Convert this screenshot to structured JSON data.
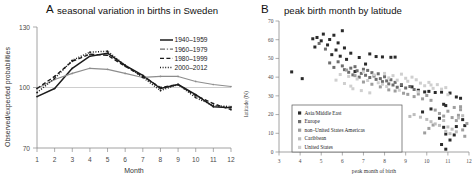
{
  "figure": {
    "panel_a": {
      "letter": "A",
      "title": "seasonal variation in births in Sweden",
      "xlabel": "Month",
      "ylabel": "Observed/expected probabilities"
    },
    "panel_b": {
      "letter": "B",
      "title": "peak birth month by latitude",
      "xlabel": "peak month of birth",
      "ylabel": "latitude (N)"
    }
  },
  "chart_data": [
    {
      "type": "line",
      "panel": "A",
      "title": "seasonal variation in births in Sweden",
      "xlabel": "Month",
      "ylabel": "Observed/expected probabilities",
      "xlim": [
        1,
        12
      ],
      "ylim": [
        70,
        130
      ],
      "yticks": [
        70,
        100,
        130
      ],
      "xticks": [
        1,
        2,
        3,
        4,
        5,
        6,
        7,
        8,
        9,
        10,
        11,
        12
      ],
      "grid": true,
      "legend_position": "top-right",
      "categories": [
        1,
        2,
        3,
        4,
        5,
        6,
        7,
        8,
        9,
        10,
        11,
        12
      ],
      "series": [
        {
          "name": "1940–1959",
          "style": "solid",
          "values": [
            95.5,
            99.5,
            109.5,
            115.5,
            117.0,
            111.0,
            106.0,
            99.5,
            101.5,
            96.5,
            90.5,
            90.0
          ]
        },
        {
          "name": "1960–1979",
          "style": "dash-dot",
          "values": [
            99.5,
            104.0,
            107.0,
            109.5,
            109.0,
            107.0,
            105.0,
            105.5,
            105.5,
            103.0,
            101.5,
            100.5
          ]
        },
        {
          "name": "1980–1999",
          "style": "dashed",
          "values": [
            99.5,
            105.5,
            113.0,
            116.5,
            116.0,
            110.5,
            105.5,
            100.0,
            101.5,
            96.0,
            92.0,
            89.0
          ]
        },
        {
          "name": "2000–2012",
          "style": "dotted",
          "values": [
            97.5,
            104.5,
            113.5,
            117.5,
            118.0,
            111.0,
            105.0,
            98.5,
            101.5,
            95.0,
            91.0,
            90.5
          ]
        }
      ]
    },
    {
      "type": "scatter",
      "panel": "B",
      "title": "peak birth month by latitude",
      "xlabel": "peak month of birth",
      "ylabel": "latitude (N)",
      "xlim": [
        3,
        12
      ],
      "ylim": [
        0,
        70
      ],
      "xticks": [
        3,
        4,
        5,
        6,
        7,
        8,
        9,
        10,
        11,
        12
      ],
      "yticks": [
        0,
        10,
        20,
        30,
        40,
        50,
        60,
        70
      ],
      "grid": false,
      "legend_position": "bottom-left",
      "series": [
        {
          "name": "Asia/Middle East",
          "color": "#2a2a2a",
          "points": [
            [
              3.6,
              42.8
            ],
            [
              4.1,
              39.2
            ],
            [
              4.6,
              60.5
            ],
            [
              4.7,
              56.1
            ],
            [
              4.8,
              61.2
            ],
            [
              5.0,
              59.4
            ],
            [
              5.1,
              63.0
            ],
            [
              5.3,
              57.2
            ],
            [
              5.4,
              60.1
            ],
            [
              5.5,
              52.0
            ],
            [
              5.6,
              62.4
            ],
            [
              5.7,
              54.5
            ],
            [
              5.8,
              58.3
            ],
            [
              5.9,
              51.2
            ],
            [
              6.0,
              64.8
            ],
            [
              6.1,
              55.6
            ],
            [
              6.2,
              49.5
            ],
            [
              6.4,
              52.8
            ],
            [
              6.6,
              43.0
            ],
            [
              6.8,
              50.5
            ],
            [
              7.1,
              47.0
            ],
            [
              7.3,
              52.4
            ],
            [
              7.6,
              51.0
            ],
            [
              7.9,
              50.8
            ],
            [
              8.3,
              50.6
            ],
            [
              8.5,
              50.7
            ],
            [
              8.8,
              35.6
            ],
            [
              9.3,
              34.8
            ],
            [
              9.6,
              33.0
            ],
            [
              9.9,
              32.1
            ],
            [
              10.1,
              32.4
            ],
            [
              10.4,
              31.8
            ],
            [
              10.7,
              32.0
            ],
            [
              11.1,
              31.5
            ],
            [
              11.4,
              29.4
            ],
            [
              11.6,
              28.7
            ],
            [
              10.8,
              25.5
            ],
            [
              10.9,
              24.8
            ],
            [
              10.6,
              18.0
            ],
            [
              10.8,
              13.2
            ],
            [
              10.9,
              9.6
            ],
            [
              11.3,
              9.1
            ],
            [
              11.4,
              13.6
            ],
            [
              11.1,
              6.4
            ],
            [
              10.7,
              4.0
            ],
            [
              10.9,
              1.5
            ],
            [
              11.7,
              17.3
            ],
            [
              11.8,
              14.1
            ],
            [
              9.8,
              21.4
            ],
            [
              10.2,
              23.0
            ]
          ]
        },
        {
          "name": "Europe",
          "color": "#6e6e6e",
          "points": [
            [
              4.9,
              58.0
            ],
            [
              5.2,
              55.0
            ],
            [
              5.4,
              47.6
            ],
            [
              5.6,
              45.2
            ],
            [
              5.8,
              48.2
            ],
            [
              6.0,
              46.0
            ],
            [
              6.1,
              44.0
            ],
            [
              6.3,
              42.6
            ],
            [
              6.4,
              44.8
            ],
            [
              6.5,
              41.2
            ],
            [
              6.6,
              45.6
            ],
            [
              6.7,
              43.4
            ],
            [
              6.8,
              40.0
            ],
            [
              6.9,
              42.0
            ],
            [
              7.0,
              44.2
            ],
            [
              7.1,
              41.0
            ],
            [
              7.2,
              43.6
            ],
            [
              7.3,
              39.8
            ],
            [
              7.4,
              42.4
            ],
            [
              7.5,
              40.6
            ],
            [
              7.6,
              38.8
            ],
            [
              7.7,
              41.8
            ],
            [
              7.8,
              39.2
            ],
            [
              7.9,
              37.6
            ],
            [
              8.0,
              40.2
            ],
            [
              8.1,
              38.0
            ],
            [
              8.2,
              36.4
            ],
            [
              8.3,
              38.6
            ],
            [
              8.4,
              35.8
            ],
            [
              8.5,
              37.2
            ],
            [
              8.6,
              34.6
            ],
            [
              8.8,
              36.0
            ],
            [
              9.0,
              34.2
            ],
            [
              9.2,
              35.0
            ],
            [
              9.4,
              33.4
            ]
          ]
        },
        {
          "name": "non–United States Americas",
          "color": "#9e9e9e",
          "points": [
            [
              6.2,
              43.8
            ],
            [
              6.6,
              40.8
            ],
            [
              7.0,
              37.4
            ],
            [
              7.4,
              36.2
            ],
            [
              7.8,
              34.8
            ],
            [
              8.2,
              33.2
            ],
            [
              8.5,
              32.6
            ],
            [
              8.9,
              31.4
            ],
            [
              9.1,
              30.8
            ],
            [
              9.4,
              29.6
            ],
            [
              9.6,
              31.0
            ],
            [
              9.8,
              28.4
            ],
            [
              10.0,
              30.2
            ],
            [
              10.2,
              27.6
            ],
            [
              10.4,
              22.4
            ],
            [
              10.6,
              20.6
            ],
            [
              10.8,
              19.2
            ],
            [
              11.0,
              21.8
            ],
            [
              11.2,
              18.4
            ],
            [
              11.4,
              16.8
            ],
            [
              11.5,
              19.6
            ],
            [
              11.6,
              22.6
            ],
            [
              11.7,
              11.8
            ],
            [
              11.8,
              8.4
            ],
            [
              11.9,
              15.2
            ],
            [
              10.3,
              14.4
            ],
            [
              10.1,
              12.6
            ],
            [
              9.9,
              10.2
            ],
            [
              11.3,
              23.8
            ],
            [
              11.6,
              24.2
            ]
          ]
        },
        {
          "name": "Caribbean",
          "color": "#bdbdbd",
          "points": [
            [
              9.7,
              18.6
            ],
            [
              10.0,
              17.4
            ],
            [
              10.2,
              16.2
            ],
            [
              10.4,
              15.0
            ],
            [
              10.6,
              14.2
            ],
            [
              10.8,
              16.8
            ],
            [
              11.0,
              13.4
            ],
            [
              11.2,
              12.2
            ],
            [
              11.4,
              10.8
            ],
            [
              11.5,
              18.2
            ],
            [
              11.7,
              19.4
            ],
            [
              9.4,
              20.0
            ],
            [
              9.2,
              19.0
            ],
            [
              10.9,
              11.0
            ],
            [
              11.1,
              9.8
            ]
          ]
        },
        {
          "name": "United States",
          "color": "#cfcfcf",
          "points": [
            [
              5.9,
              41.4
            ],
            [
              6.3,
              40.4
            ],
            [
              6.7,
              39.0
            ],
            [
              7.0,
              42.8
            ],
            [
              7.2,
              38.2
            ],
            [
              7.5,
              41.2
            ],
            [
              7.7,
              37.0
            ],
            [
              8.0,
              42.0
            ],
            [
              8.2,
              39.6
            ],
            [
              8.4,
              40.8
            ],
            [
              8.6,
              38.4
            ],
            [
              8.8,
              41.6
            ],
            [
              9.0,
              39.4
            ],
            [
              9.1,
              37.8
            ],
            [
              9.3,
              40.0
            ],
            [
              9.5,
              38.6
            ],
            [
              9.7,
              36.8
            ],
            [
              9.9,
              35.4
            ],
            [
              10.1,
              37.2
            ],
            [
              10.3,
              34.0
            ],
            [
              10.5,
              36.0
            ],
            [
              10.7,
              33.6
            ],
            [
              6.5,
              33.8
            ],
            [
              6.9,
              32.8
            ],
            [
              7.3,
              31.6
            ],
            [
              5.7,
              38.4
            ],
            [
              6.1,
              36.6
            ],
            [
              6.4,
              35.2
            ],
            [
              8.1,
              35.0
            ],
            [
              8.7,
              33.0
            ],
            [
              9.6,
              32.2
            ],
            [
              10.2,
              35.8
            ],
            [
              10.9,
              34.4
            ],
            [
              11.0,
              30.6
            ],
            [
              7.9,
              36.2
            ]
          ]
        }
      ]
    }
  ]
}
